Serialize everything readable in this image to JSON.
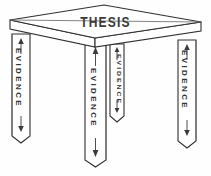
{
  "figure": {
    "title": "THESIS",
    "kind": "line-drawing-diagram",
    "background_color": "#fefefe",
    "line_color": "#2f2f2f",
    "text_color": "#3a3a3a"
  },
  "tabletop": {
    "label": "THESIS",
    "shape": "parallelogram-perspective",
    "thickness_px": 9
  },
  "legs": [
    {
      "id": "left",
      "label": "EVIDENCE",
      "position": "front-left",
      "arrow": "double-vertical"
    },
    {
      "id": "front",
      "label": "EVIDENCE",
      "position": "front-center",
      "arrow": "double-vertical"
    },
    {
      "id": "back",
      "label": "EVIDENCE",
      "position": "back-right",
      "arrow": "double-vertical"
    },
    {
      "id": "right",
      "label": "EVIDENCE",
      "position": "front-right",
      "arrow": "double-vertical"
    }
  ]
}
